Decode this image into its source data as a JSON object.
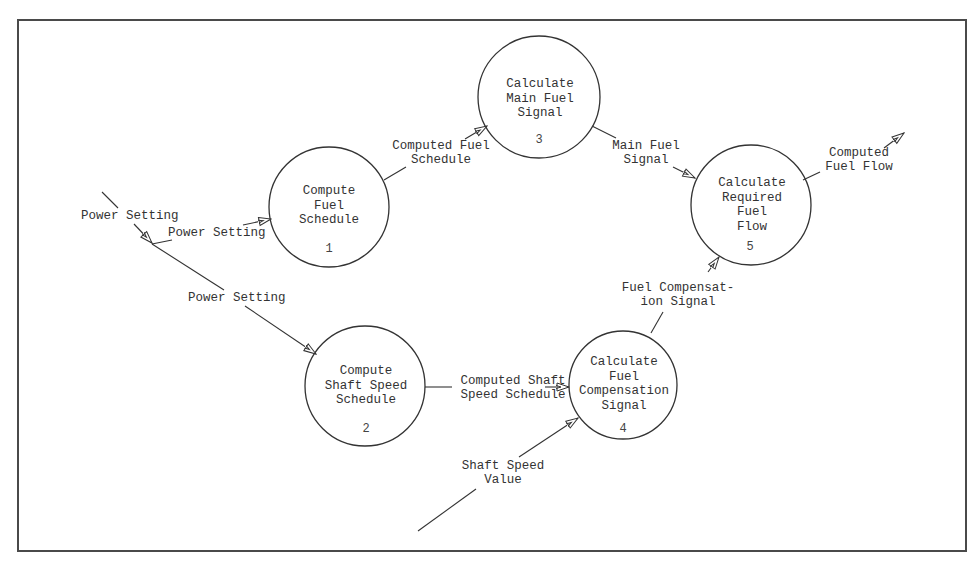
{
  "diagram": {
    "type": "data-flow-diagram",
    "colors": {
      "line": "#333333",
      "text": "#333333",
      "frame": "#4a4a4a",
      "background": "#ffffff"
    },
    "processes": [
      {
        "id": "1",
        "number": "1",
        "label": "Compute\nFuel\nSchedule"
      },
      {
        "id": "2",
        "number": "2",
        "label": "Compute\nShaft Speed\nSchedule"
      },
      {
        "id": "3",
        "number": "3",
        "label": "Calculate\nMain Fuel\nSignal"
      },
      {
        "id": "4",
        "number": "4",
        "label": "Calculate\nFuel\nCompensation\nSignal"
      },
      {
        "id": "5",
        "number": "5",
        "label": "Calculate\nRequired\nFuel\nFlow"
      }
    ],
    "flows": [
      {
        "id": "ext_power",
        "label": "Power Setting",
        "from": "external",
        "to": "split"
      },
      {
        "id": "power_to_1",
        "label": "Power Setting",
        "from": "split",
        "to": "1"
      },
      {
        "id": "power_to_2",
        "label": "Power Setting",
        "from": "split",
        "to": "2"
      },
      {
        "id": "comp_fuel_sched",
        "label": "Computed Fuel\nSchedule",
        "from": "1",
        "to": "3"
      },
      {
        "id": "main_fuel_signal",
        "label": "Main Fuel\nSignal",
        "from": "3",
        "to": "5"
      },
      {
        "id": "comp_fuel_flow",
        "label": "Computed\nFuel Flow",
        "from": "5",
        "to": "external"
      },
      {
        "id": "comp_shaft_sched",
        "label": "Computed Shaft\nSpeed Schedule",
        "from": "2",
        "to": "4"
      },
      {
        "id": "shaft_speed_value",
        "label": "Shaft Speed\nValue",
        "from": "external",
        "to": "4"
      },
      {
        "id": "fuel_comp_signal",
        "label": "Fuel Compensat-\nion Signal",
        "from": "4",
        "to": "5"
      }
    ]
  }
}
